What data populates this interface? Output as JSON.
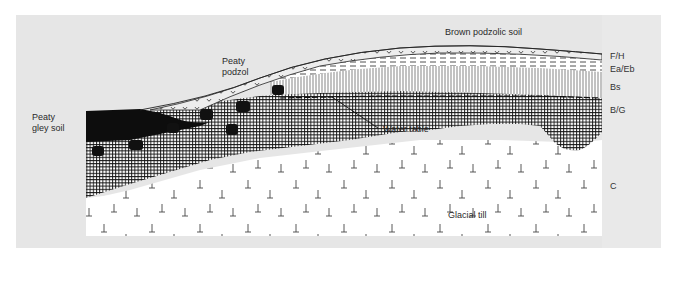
{
  "figure": {
    "colors": {
      "panel_gray": "#e6e6e6",
      "strip_gray": "#e9e9e9",
      "diagram_white": "#ffffff",
      "ink": "#1a1a1a",
      "peat_black": "#0d0d0d"
    },
    "profiles": {
      "peaty_gley_soil": {
        "line1": "Peaty",
        "line2": "gley soil"
      },
      "peaty_podzol": {
        "line1": "Peaty",
        "line2": "podzol"
      },
      "brown_podzolic_soil": "Brown podzolic soil"
    },
    "annotations": {
      "water_table": "Water table",
      "glacial_till": "Glacial till"
    },
    "horizons": [
      {
        "code": "F/H",
        "pattern": "humus-curls"
      },
      {
        "code": "Ea/Eb",
        "pattern": "dashed-lines"
      },
      {
        "code": "Bs",
        "pattern": "vertical-lines"
      },
      {
        "code": "B/G",
        "pattern": "cross-hatch-grid"
      },
      {
        "code": "C",
        "pattern": "inverted-T-stones"
      }
    ]
  }
}
